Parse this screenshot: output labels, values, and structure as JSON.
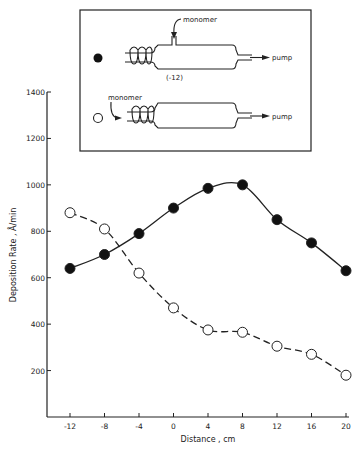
{
  "figure": {
    "inset": {
      "top_reactor": {
        "marker": "filled-circle",
        "monomer_label": "monomer",
        "position_label": "(-12)",
        "pump_label": "pump"
      },
      "bottom_reactor": {
        "marker": "open-circle",
        "monomer_label": "monomer",
        "pump_label": "pump"
      }
    }
  },
  "chart_data": {
    "type": "line",
    "title": "",
    "xlabel": "Distance , cm",
    "ylabel": "Deposition Rate , Å/min",
    "x": [
      -12,
      -8,
      -4,
      0,
      4,
      8,
      12,
      16,
      20
    ],
    "xticks": [
      "-12",
      "-8",
      "-4",
      "0",
      "4",
      "8",
      "12",
      "16",
      "20"
    ],
    "yticks": [
      "200",
      "400",
      "600",
      "800",
      "1000",
      "1200",
      "1400"
    ],
    "xlim": [
      -14,
      20
    ],
    "ylim": [
      0,
      1400
    ],
    "grid": false,
    "legend": "inset diagram (filled circle = monomer fed downstream at -12; open circle = monomer fed through coil region)",
    "series": [
      {
        "name": "monomer fed downstream of coil (filled circles)",
        "marker": "filled-circle",
        "line": "solid",
        "values": [
          640,
          700,
          790,
          900,
          985,
          1000,
          850,
          750,
          630
        ]
      },
      {
        "name": "monomer fed through coil (open circles)",
        "marker": "open-circle",
        "line": "dashed",
        "values": [
          880,
          810,
          620,
          470,
          375,
          365,
          305,
          270,
          180
        ]
      }
    ]
  }
}
